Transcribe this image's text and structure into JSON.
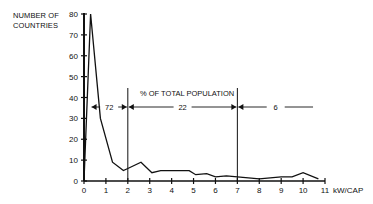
{
  "chart_data": {
    "type": "line",
    "title": "",
    "ylabel": "NUMBER OF COUNTRIES",
    "xlabel": "kW/CAP",
    "xlim": [
      0,
      11
    ],
    "ylim": [
      0,
      80
    ],
    "x_ticks": [
      "0",
      "1",
      "2",
      "3",
      "4",
      "5",
      "6",
      "7",
      "8",
      "9",
      "10",
      "11"
    ],
    "y_ticks": [
      "0",
      "10",
      "20",
      "30",
      "40",
      "50",
      "60",
      "70",
      "80"
    ],
    "grid": false,
    "legend": null,
    "series": [
      {
        "name": "Number of countries",
        "x": [
          0,
          0.3,
          0.75,
          1.3,
          1.8,
          2.0,
          2.6,
          3.1,
          3.5,
          4.0,
          4.8,
          5.1,
          5.6,
          6.0,
          6.5,
          7.0,
          8.0,
          9.0,
          9.5,
          10.0,
          10.7
        ],
        "values": [
          0,
          80,
          30,
          9,
          5,
          6,
          9,
          4,
          5,
          5,
          5,
          3,
          3.5,
          2,
          2.5,
          2,
          1,
          2,
          2,
          4,
          1
        ]
      }
    ],
    "annotations": {
      "header": "% OF TOTAL POPULATION",
      "ranges": [
        {
          "from": 0.3,
          "to": 2,
          "label": "72"
        },
        {
          "from": 2,
          "to": 7,
          "label": "22"
        },
        {
          "from": 7,
          "to": 10.5,
          "label": "6"
        }
      ],
      "vertical_markers": [
        2,
        7
      ]
    }
  },
  "labels": {
    "y_axis_line1": "NUMBER OF",
    "y_axis_line2": "COUNTRIES",
    "x_axis_unit": "kW/CAP",
    "population_header": "% OF TOTAL POPULATION",
    "range1": "72",
    "range2": "22",
    "range3": "6"
  }
}
